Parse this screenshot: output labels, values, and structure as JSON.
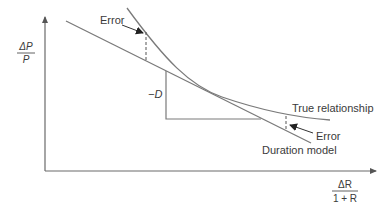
{
  "diagram": {
    "type": "duration-approximation",
    "axes": {
      "y_label_numerator": "ΔP",
      "y_label_denominator": "P",
      "x_label_numerator": "ΔR",
      "x_label_denominator": "1 + R"
    },
    "labels": {
      "error_top": "Error",
      "slope": "−D",
      "true_relationship": "True relationship",
      "error_bottom": "Error",
      "duration_model": "Duration model"
    },
    "colors": {
      "line": "#7a7a7a",
      "text": "#3a3a3a",
      "background": "#ffffff"
    }
  }
}
